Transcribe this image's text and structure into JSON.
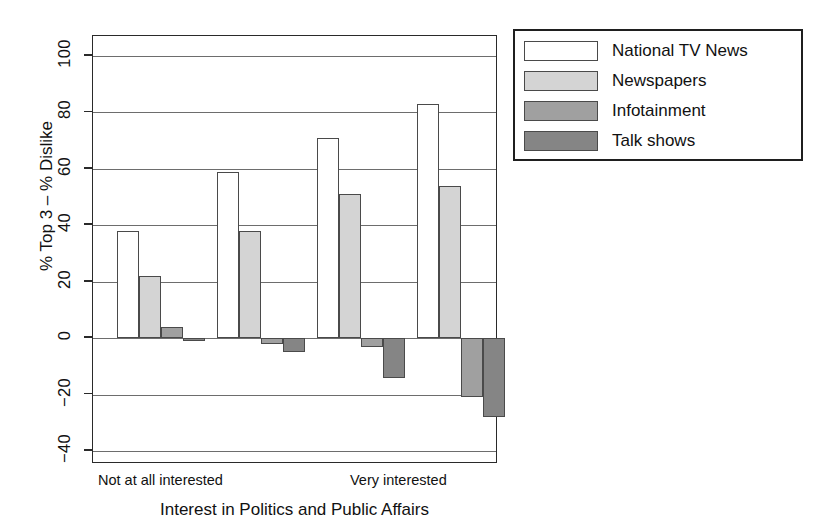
{
  "chart_data": {
    "type": "bar",
    "title": "",
    "xlabel": "Interest in Politics and Public Affairs",
    "ylabel": "% Top 3 – % Dislike",
    "ylim": [
      -45,
      107
    ],
    "yticks": [
      100,
      80,
      60,
      40,
      20,
      0,
      -20,
      -40
    ],
    "ytick_labels": [
      "100",
      "80",
      "60",
      "40",
      "20",
      "0",
      "−20",
      "−40"
    ],
    "grid": true,
    "grid_axis": "y",
    "legend_position": "upper right outside",
    "categories": [
      "Not at all interested",
      "",
      "",
      "Very interested"
    ],
    "category_axis_labels": [
      {
        "text": "Not at all interested",
        "group": 1
      },
      {
        "text": "Very interested",
        "group": 4
      }
    ],
    "series": [
      {
        "name": "National TV News",
        "color": "#ffffff",
        "values": [
          38,
          59,
          71,
          83
        ]
      },
      {
        "name": "Newspapers",
        "color": "#d4d4d4",
        "values": [
          22,
          38,
          51,
          54
        ]
      },
      {
        "name": "Infotainment",
        "color": "#a0a0a0",
        "values": [
          4,
          -2,
          -3,
          -21
        ]
      },
      {
        "name": "Talk shows",
        "color": "#858585",
        "values": [
          -1,
          -5,
          -14,
          -28
        ]
      }
    ]
  },
  "legend": {
    "items": [
      {
        "label": "National TV News",
        "swatch": "#ffffff"
      },
      {
        "label": "Newspapers",
        "swatch": "#d4d4d4"
      },
      {
        "label": "Infotainment",
        "swatch": "#a0a0a0"
      },
      {
        "label": "Talk shows",
        "swatch": "#858585"
      }
    ]
  },
  "axes": {
    "y_title": "% Top 3 – % Dislike",
    "x_title": "Interest in Politics and Public Affairs",
    "y_tick_labels": [
      "100",
      "80",
      "60",
      "40",
      "20",
      "0",
      "−20",
      "−40"
    ],
    "x_left_label": "Not at all interested",
    "x_right_label": "Very interested"
  },
  "colors": {
    "frame": "#2a2a2a",
    "grid": "#6d6d6d",
    "bar_outline": "#4a4a4a",
    "background": "#ffffff"
  }
}
